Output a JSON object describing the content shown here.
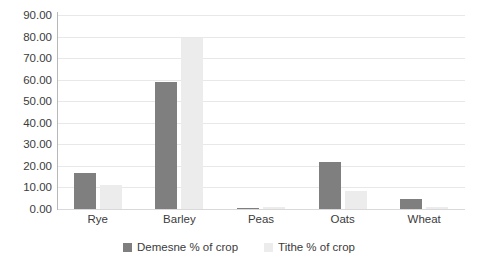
{
  "chart_data": {
    "type": "bar",
    "title": "",
    "subtitle": "",
    "xlabel": "",
    "ylabel": "",
    "categories": [
      "Rye",
      "Barley",
      "Peas",
      "Oats",
      "Wheat"
    ],
    "series": [
      {
        "name": "Demesne % of crop",
        "color": "#7f7f7f",
        "values": [
          16.5,
          59.0,
          0.4,
          22.0,
          4.5
        ]
      },
      {
        "name": "Tithe % of crop",
        "color": "#ececec",
        "values": [
          11.0,
          79.5,
          0.8,
          8.5,
          1.0
        ]
      }
    ],
    "ylim": [
      0,
      90
    ],
    "y_tick_step": 10,
    "y_tick_labels": [
      "0.00",
      "10.00",
      "20.00",
      "30.00",
      "40.00",
      "50.00",
      "60.00",
      "70.00",
      "80.00",
      "90.00"
    ],
    "grid": true,
    "grid_axis": "y",
    "legend_position": "bottom",
    "legend_entries": [
      "Demesne % of crop",
      "Tithe % of crop"
    ],
    "annotations": [],
    "colors": {
      "demesne": "#7f7f7f",
      "tithe": "#ececec",
      "gridline": "#e8e8e8",
      "axis": "#b8b8b8",
      "text": "#3b3b3b",
      "background": "#ffffff"
    }
  }
}
